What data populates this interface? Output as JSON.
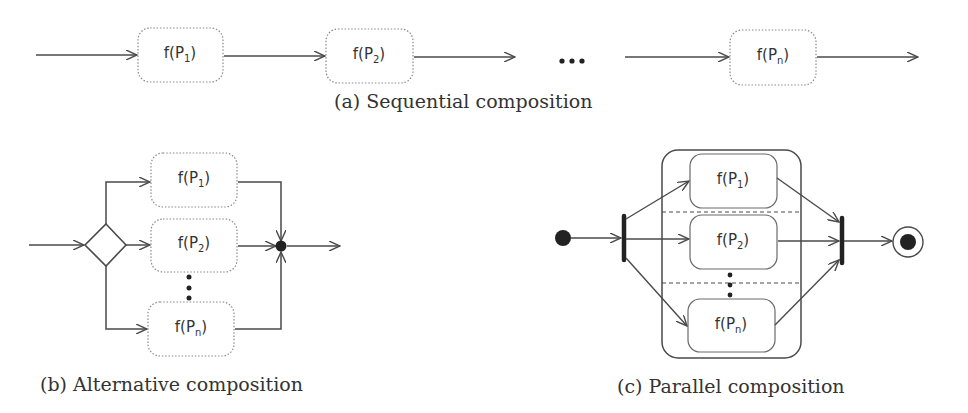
{
  "figure": {
    "colors": {
      "line": "#4a4a4a",
      "dotted_border": "#8a8a8a",
      "solid_border": "#6a6a6a",
      "node_fill": "#222222",
      "text": "#333333",
      "background": "#ffffff"
    },
    "sequential": {
      "caption": "(a) Sequential composition",
      "boxes": [
        {
          "func": "f(P",
          "sub": "1",
          "close": ")"
        },
        {
          "func": "f(P",
          "sub": "2",
          "close": ")"
        },
        {
          "func": "f(P",
          "sub": "n",
          "close": ")"
        }
      ],
      "ellipsis": "•••"
    },
    "alternative": {
      "caption": "(b) Alternative composition",
      "boxes": [
        {
          "func": "f(P",
          "sub": "1",
          "close": ")"
        },
        {
          "func": "f(P",
          "sub": "2",
          "close": ")"
        },
        {
          "func": "f(P",
          "sub": "n",
          "close": ")"
        }
      ],
      "decision_node": "diamond",
      "merge_node": "filled-circle"
    },
    "parallel": {
      "caption": "(c) Parallel composition",
      "boxes": [
        {
          "func": "f(P",
          "sub": "1",
          "close": ")"
        },
        {
          "func": "f(P",
          "sub": "2",
          "close": ")"
        },
        {
          "func": "f(P",
          "sub": "n",
          "close": ")"
        }
      ],
      "initial_node": "filled-circle",
      "fork_bar": "fork",
      "join_bar": "join",
      "final_node": "bullseye"
    }
  }
}
